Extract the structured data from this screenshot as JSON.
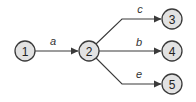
{
  "diagram": {
    "type": "directed-graph",
    "nodes": [
      {
        "id": "1",
        "label": "1"
      },
      {
        "id": "2",
        "label": "2"
      },
      {
        "id": "3",
        "label": "3"
      },
      {
        "id": "4",
        "label": "4"
      },
      {
        "id": "5",
        "label": "5"
      }
    ],
    "edges": [
      {
        "from": "1",
        "to": "2",
        "label": "a"
      },
      {
        "from": "2",
        "to": "3",
        "label": "c"
      },
      {
        "from": "2",
        "to": "4",
        "label": "b"
      },
      {
        "from": "2",
        "to": "5",
        "label": "e"
      }
    ]
  },
  "colors": {
    "node_fill": "#e2e2e2",
    "stroke": "#3a3a3a"
  }
}
